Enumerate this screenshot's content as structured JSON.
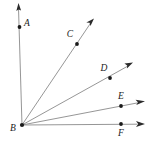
{
  "figure": {
    "kind": "geometry-ray-diagram",
    "width": 152,
    "height": 147,
    "background_color": "#ffffff",
    "line_color": "#8a8a8a",
    "arrow_color": "#2b2b2b",
    "label_color": "#1a1a1a",
    "vertex": {
      "name": "B",
      "label": "B",
      "x": 22,
      "y": 125,
      "label_x": 13,
      "label_y": 129
    },
    "rays": [
      {
        "name": "ray-BA",
        "label": "A",
        "point_x": 19.5,
        "point_y": 27,
        "label_x": 27,
        "label_y": 24,
        "tip_x": 18.5,
        "tip_y": 4
      },
      {
        "name": "ray-BC",
        "label": "C",
        "point_x": 77,
        "point_y": 44,
        "label_x": 70,
        "label_y": 35,
        "tip_x": 93,
        "tip_y": 20
      },
      {
        "name": "ray-BD",
        "label": "D",
        "point_x": 110,
        "point_y": 78,
        "label_x": 104,
        "label_y": 69,
        "tip_x": 132,
        "tip_y": 63
      },
      {
        "name": "ray-BE",
        "label": "E",
        "point_x": 121,
        "point_y": 106,
        "label_x": 121,
        "label_y": 97,
        "tip_x": 144,
        "tip_y": 101
      },
      {
        "name": "ray-BF",
        "label": "F",
        "point_x": 121,
        "point_y": 124,
        "label_x": 121,
        "label_y": 134,
        "tip_x": 144,
        "tip_y": 124
      }
    ]
  }
}
